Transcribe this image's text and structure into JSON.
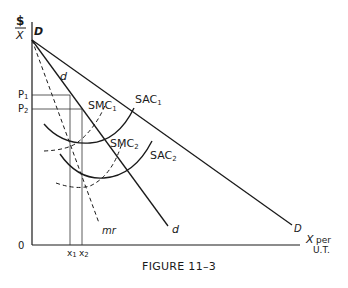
{
  "figure": {
    "caption": "FIGURE 11–3",
    "y_axis_label_top": "$",
    "y_axis_label_bottom": "X",
    "x_axis_label_line1": "X per",
    "x_axis_label_line2": "U.T.",
    "origin_label": "0"
  },
  "labels": {
    "D_top": "D",
    "D_bottom": "D",
    "d_top": "d",
    "d_bottom": "d",
    "mr": "mr",
    "P1": "P",
    "P1_sub": "1",
    "P2": "P",
    "P2_sub": "2",
    "x1": "x",
    "x1_sub": "1",
    "x2": "x",
    "x2_sub": "2",
    "SMC1": "SMC",
    "SMC1_sub": "1",
    "SMC2": "SMC",
    "SMC2_sub": "2",
    "SAC1": "SAC",
    "SAC1_sub": "1",
    "SAC2": "SAC",
    "SAC2_sub": "2"
  },
  "curves": [
    {
      "name": "D",
      "style": "solid",
      "description": "Market demand curve"
    },
    {
      "name": "d",
      "style": "solid",
      "description": "Firm demand curve"
    },
    {
      "name": "mr",
      "style": "dashed",
      "description": "Marginal revenue"
    },
    {
      "name": "SAC1",
      "style": "solid",
      "description": "Short-run average cost 1"
    },
    {
      "name": "SMC1",
      "style": "dashed",
      "description": "Short-run marginal cost 1"
    },
    {
      "name": "SAC2",
      "style": "solid",
      "description": "Short-run average cost 2"
    },
    {
      "name": "SMC2",
      "style": "dashed",
      "description": "Short-run marginal cost 2"
    }
  ],
  "colors": {
    "ink": "#1a1a1a",
    "background": "#ffffff"
  }
}
